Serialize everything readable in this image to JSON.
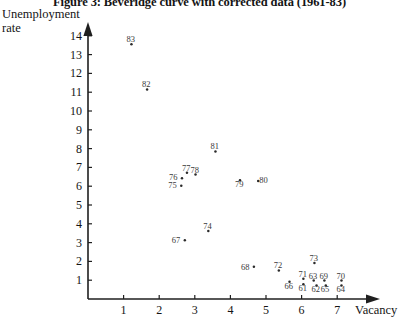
{
  "figure": {
    "title": "Figure 3: Beveridge curve with corrected data (1961-83)",
    "ylabel_line1": "Unemployment",
    "ylabel_line2": "rate",
    "xlabel": "Vacancy"
  },
  "chart_data": {
    "type": "scatter",
    "title": "Figure 3: Beveridge curve with corrected data (1961-83)",
    "xlabel": "Vacancy",
    "ylabel": "Unemployment rate",
    "xlim": [
      0,
      7.8
    ],
    "ylim": [
      0,
      14.6
    ],
    "xticks": [
      1,
      2,
      3,
      4,
      5,
      6,
      7
    ],
    "yticks": [
      1,
      2,
      3,
      4,
      5,
      6,
      7,
      8,
      9,
      10,
      11,
      12,
      13,
      14
    ],
    "grid": false,
    "legend": "none",
    "point_label_field": "year",
    "points": [
      {
        "label": "83",
        "x": 1.22,
        "y": 13.55,
        "label_dx": -3,
        "label_dy": -8
      },
      {
        "label": "82",
        "x": 1.66,
        "y": 11.15,
        "label_dx": -3,
        "label_dy": -8
      },
      {
        "label": "81",
        "x": 3.58,
        "y": 7.85,
        "label_dx": -3,
        "label_dy": -8
      },
      {
        "label": "77",
        "x": 2.78,
        "y": 6.72,
        "label_dx": -3,
        "label_dy": -8
      },
      {
        "label": "78",
        "x": 3.02,
        "y": 6.62,
        "label_dx": -3,
        "label_dy": -8
      },
      {
        "label": "76",
        "x": 2.64,
        "y": 6.42,
        "label_dx": -11,
        "label_dy": -4
      },
      {
        "label": "75",
        "x": 2.62,
        "y": 6.02,
        "label_dx": -11,
        "label_dy": -4
      },
      {
        "label": "80",
        "x": 4.78,
        "y": 6.28,
        "label_dx": 3,
        "label_dy": -4
      },
      {
        "label": "79",
        "x": 4.27,
        "y": 6.32,
        "label_dx": -3,
        "label_dy": 1
      },
      {
        "label": "74",
        "x": 3.38,
        "y": 3.62,
        "label_dx": -3,
        "label_dy": -8
      },
      {
        "label": "67",
        "x": 2.72,
        "y": 3.12,
        "label_dx": -11,
        "label_dy": -3
      },
      {
        "label": "68",
        "x": 4.66,
        "y": 1.72,
        "label_dx": -11,
        "label_dy": -3
      },
      {
        "label": "73",
        "x": 6.36,
        "y": 1.92,
        "label_dx": -3,
        "label_dy": -8
      },
      {
        "label": "72",
        "x": 5.36,
        "y": 1.52,
        "label_dx": -3,
        "label_dy": -8
      },
      {
        "label": "71",
        "x": 6.05,
        "y": 1.08,
        "label_dx": -3,
        "label_dy": -8
      },
      {
        "label": "63",
        "x": 6.34,
        "y": 0.98,
        "label_dx": -3,
        "label_dy": -8
      },
      {
        "label": "69",
        "x": 6.64,
        "y": 0.98,
        "label_dx": -3,
        "label_dy": -8
      },
      {
        "label": "70",
        "x": 7.12,
        "y": 0.98,
        "label_dx": -3,
        "label_dy": -8
      },
      {
        "label": "66",
        "x": 5.66,
        "y": 0.92,
        "label_dx": -3,
        "label_dy": 1
      },
      {
        "label": "61",
        "x": 6.05,
        "y": 0.78,
        "label_dx": -3,
        "label_dy": 1
      },
      {
        "label": "62",
        "x": 6.42,
        "y": 0.72,
        "label_dx": -3,
        "label_dy": 1
      },
      {
        "label": "65",
        "x": 6.68,
        "y": 0.72,
        "label_dx": -3,
        "label_dy": 1
      },
      {
        "label": "64",
        "x": 7.12,
        "y": 0.72,
        "label_dx": -3,
        "label_dy": 1
      }
    ]
  },
  "axes_geometry": {
    "origin_x": 88,
    "origin_y": 299,
    "x_unit_px": 35.6,
    "y_unit_px": 18.8
  },
  "colors": {
    "ink": "#141414",
    "point": "#2b2b2b",
    "label": "#3a3a3a"
  }
}
